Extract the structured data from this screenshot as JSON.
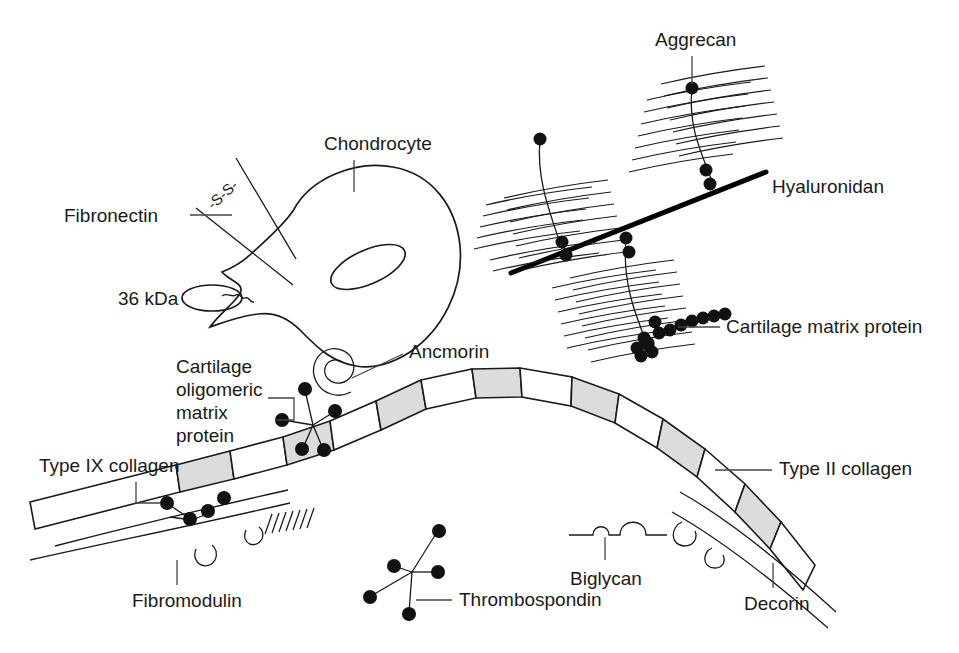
{
  "figure": {
    "background_color": "#ffffff",
    "line_color": "#1a1a1a",
    "fill_gray": "#dcdcdc"
  },
  "labels": {
    "chondrocyte": "Chondrocyte",
    "fibronectin": "Fibronectin",
    "disulfide": "-S-S-",
    "kda36": "36 kDa",
    "aggrecan": "Aggrecan",
    "hyaluronidan": "Hyaluronidan",
    "cartilage_matrix_protein": "Cartilage matrix protein",
    "ancmorin": "Ancmorin",
    "comp_line1": "Cartilage",
    "comp_line2": "oligomeric",
    "comp_line3": "matrix",
    "comp_line4": "protein",
    "type_ix_collagen": "Type IX collagen",
    "type_ii_collagen": "Type II collagen",
    "fibromodulin": "Fibromodulin",
    "thrombospondin": "Thrombospondin",
    "biglycan": "Biglycan",
    "decorin": "Decorin"
  },
  "components": [
    {
      "name": "chondrocyte",
      "label": "Chondrocyte",
      "shape": "teardrop-cell",
      "nucleus": "gray-ellipse"
    },
    {
      "name": "fibronectin",
      "label": "Fibronectin",
      "shape": "two-arms-disulfide"
    },
    {
      "name": "36-kda-protein",
      "label": "36 kDa",
      "shape": "gray-ellipse"
    },
    {
      "name": "aggrecan",
      "label": "Aggrecan",
      "shape": "bottlebrush",
      "count": 3,
      "bristles_per_unit": 14
    },
    {
      "name": "hyaluronan",
      "label": "Hyaluronidan",
      "shape": "thick-line"
    },
    {
      "name": "cartilage-matrix-protein",
      "label": "Cartilage matrix protein",
      "shape": "dot-chain",
      "dot_count": 14
    },
    {
      "name": "ancmorin",
      "label": "Ancmorin",
      "shape": "spiral"
    },
    {
      "name": "cartilage-oligomeric-matrix-protein",
      "label": "Cartilage oligomeric matrix protein",
      "shape": "five-arm-star"
    },
    {
      "name": "type-ix-collagen",
      "label": "Type IX collagen",
      "shape": "dot-cluster"
    },
    {
      "name": "type-ii-collagen",
      "label": "Type II collagen",
      "shape": "banded-fibril"
    },
    {
      "name": "fibromodulin",
      "label": "Fibromodulin",
      "shape": "loop-with-bristles"
    },
    {
      "name": "thrombospondin",
      "label": "Thrombospondin",
      "shape": "five-arm-star"
    },
    {
      "name": "biglycan",
      "label": "Biglycan",
      "shape": "line-two-loops"
    },
    {
      "name": "decorin",
      "label": "Decorin",
      "shape": "line-one-loop"
    }
  ]
}
